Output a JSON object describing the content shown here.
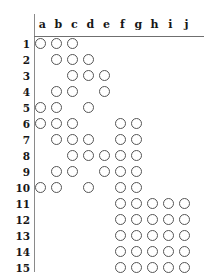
{
  "figure": {
    "type": "dot-grid-matrix",
    "columns": [
      "a",
      "b",
      "c",
      "d",
      "e",
      "f",
      "g",
      "h",
      "i",
      "j"
    ],
    "rows": [
      "1",
      "2",
      "3",
      "4",
      "5",
      "6",
      "7",
      "8",
      "9",
      "10",
      "11",
      "12",
      "13",
      "14",
      "15"
    ],
    "marker": "open-circle",
    "colors": {
      "background": "#ffffff",
      "rule": "#8a8a8a",
      "marker_stroke": "#555555",
      "text": "#161616"
    },
    "geometry": {
      "column_pitch_px": 16,
      "row_pitch_px": 16,
      "marker_diameter_px": 11,
      "grid_origin_x_px": 34,
      "grid_origin_y_px": 38
    },
    "marks": [
      {
        "row": "1",
        "columns": [
          "a",
          "b",
          "c"
        ]
      },
      {
        "row": "2",
        "columns": [
          "b",
          "c",
          "d"
        ]
      },
      {
        "row": "3",
        "columns": [
          "c",
          "d",
          "e"
        ]
      },
      {
        "row": "4",
        "columns": [
          "b",
          "c",
          "e"
        ]
      },
      {
        "row": "5",
        "columns": [
          "a",
          "b",
          "d"
        ]
      },
      {
        "row": "6",
        "columns": [
          "a",
          "b",
          "c",
          "f",
          "g"
        ]
      },
      {
        "row": "7",
        "columns": [
          "b",
          "c",
          "d",
          "f",
          "g"
        ]
      },
      {
        "row": "8",
        "columns": [
          "c",
          "d",
          "e",
          "f",
          "g"
        ]
      },
      {
        "row": "9",
        "columns": [
          "b",
          "c",
          "e",
          "f",
          "g"
        ]
      },
      {
        "row": "10",
        "columns": [
          "a",
          "b",
          "d",
          "f",
          "g"
        ]
      },
      {
        "row": "11",
        "columns": [
          "f",
          "g",
          "h",
          "i",
          "j"
        ]
      },
      {
        "row": "12",
        "columns": [
          "f",
          "g",
          "h",
          "i",
          "j"
        ]
      },
      {
        "row": "13",
        "columns": [
          "f",
          "g",
          "h",
          "i",
          "j"
        ]
      },
      {
        "row": "14",
        "columns": [
          "f",
          "g",
          "h",
          "i",
          "j"
        ]
      },
      {
        "row": "15",
        "columns": [
          "f",
          "g",
          "h",
          "i",
          "j"
        ]
      }
    ]
  }
}
